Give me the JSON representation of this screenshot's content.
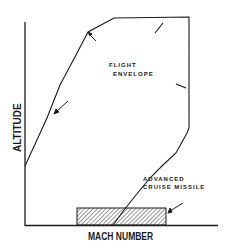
{
  "diagram": {
    "type": "flight-envelope-plot",
    "axes": {
      "x_label": "MACH NUMBER",
      "y_label": "ALTITUDE"
    },
    "labels": {
      "envelope_line1": "FLIGHT",
      "envelope_line2": "ENVELOPE",
      "missile_line1": "ADVANCED",
      "missile_line2": "CRUISE MISSILE"
    },
    "colors": {
      "ink": "#1a1a1a",
      "background": "#ffffff"
    }
  }
}
